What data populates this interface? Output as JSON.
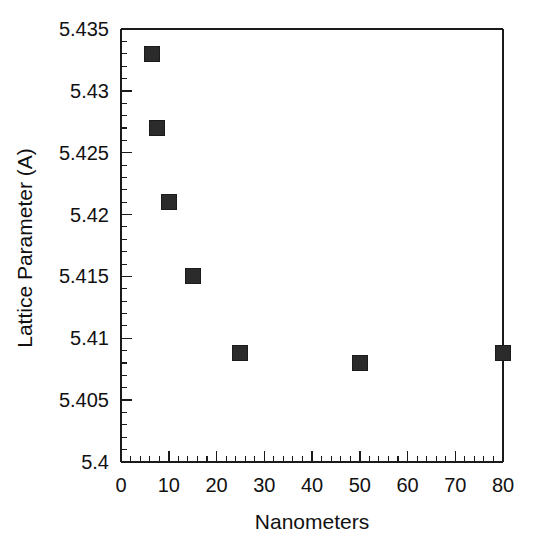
{
  "chart_data": {
    "type": "scatter",
    "title": "",
    "xlabel": "Nanometers",
    "ylabel": "Lattice Parameter (A)",
    "xlim": [
      0,
      80
    ],
    "ylim": [
      5.4,
      5.435
    ],
    "grid": false,
    "legend": null,
    "x_major_ticks": [
      0,
      10,
      20,
      30,
      40,
      50,
      60,
      70,
      80
    ],
    "x_tick_labels": [
      "0",
      "10",
      "20",
      "30",
      "40",
      "50",
      "60",
      "70",
      "80"
    ],
    "x_minor_step": 2,
    "y_major_ticks": [
      5.4,
      5.405,
      5.41,
      5.415,
      5.42,
      5.425,
      5.43,
      5.435
    ],
    "y_tick_labels": [
      "5.4",
      "5.405",
      "5.41",
      "5.415",
      "5.42",
      "5.425",
      "5.43",
      "5.435"
    ],
    "y_minor_step": 0.001,
    "marker": "filled-square",
    "marker_color": "#2b2b2b",
    "x": [
      6.5,
      7.5,
      10,
      15,
      25,
      50,
      80
    ],
    "values": [
      5.433,
      5.427,
      5.421,
      5.415,
      5.4088,
      5.408,
      5.4088
    ],
    "points": [
      {
        "x": 6.5,
        "y": 5.433
      },
      {
        "x": 7.5,
        "y": 5.427
      },
      {
        "x": 10,
        "y": 5.421
      },
      {
        "x": 15,
        "y": 5.415
      },
      {
        "x": 25,
        "y": 5.4088
      },
      {
        "x": 50,
        "y": 5.408
      },
      {
        "x": 80,
        "y": 5.4088
      }
    ]
  }
}
